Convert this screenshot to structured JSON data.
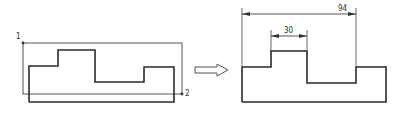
{
  "diagram": {
    "left_figure": {
      "point_labels": [
        "1",
        "2"
      ],
      "bounding_box": {
        "x1": 23,
        "y1": 43,
        "x2": 182,
        "y2": 94
      },
      "profile_points": "29,102 29,66 58,66 58,50 95,50 95,82 144,82 144,67 174,67 174,102 29,102"
    },
    "arrow": {
      "icon": "hollow-right-arrow-icon"
    },
    "right_figure": {
      "profile_points": "242,102 242,67 271,67 271,51 307,51 307,83 356,83 356,67 386,67 386,102 242,102",
      "dimensions": [
        {
          "label": "94",
          "x1": 242,
          "x2": 356,
          "y": 14
        },
        {
          "label": "30",
          "x1": 271,
          "x2": 307,
          "y": 36
        }
      ]
    },
    "colors": {
      "line": "#2a2a2a",
      "thin_line": "#555555"
    }
  }
}
